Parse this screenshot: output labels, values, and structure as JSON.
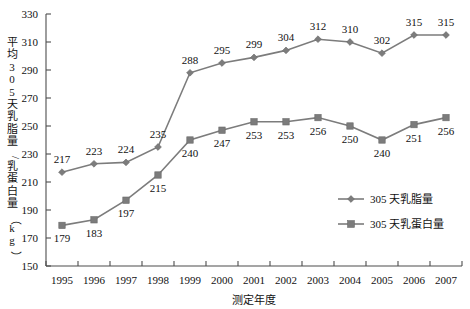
{
  "chart_data": {
    "type": "line",
    "title": "",
    "xlabel": "测定年度",
    "ylabel": "平均305天乳脂量/乳蛋白量（kg）",
    "ylabel_chars": [
      "平",
      "均",
      "3",
      "0",
      "5",
      "天",
      "乳",
      "脂",
      "量",
      "/",
      "乳",
      "蛋",
      "白",
      "量",
      "（",
      "k",
      "g",
      "）"
    ],
    "categories": [
      "1995",
      "1996",
      "1997",
      "1998",
      "1999",
      "2000",
      "2001",
      "2002",
      "2003",
      "2004",
      "2005",
      "2006",
      "2007"
    ],
    "x": [
      1995,
      1996,
      1997,
      1998,
      1999,
      2000,
      2001,
      2002,
      2003,
      2004,
      2005,
      2006,
      2007
    ],
    "ylim": [
      150,
      330
    ],
    "ytick_step": 20,
    "yticks": [
      "330",
      "310",
      "290",
      "270",
      "250",
      "230",
      "210",
      "190",
      "170",
      "150"
    ],
    "ytick_values": [
      330,
      310,
      290,
      270,
      250,
      230,
      210,
      190,
      170,
      150
    ],
    "grid": false,
    "legend_position": "inside-right-lower",
    "series": [
      {
        "name": "305 天乳脂量",
        "marker": "diamond",
        "color": "#7c7c7c",
        "values": [
          217,
          223,
          224,
          235,
          288,
          295,
          299,
          304,
          312,
          310,
          302,
          315,
          315
        ],
        "label_positions": [
          "above",
          "above",
          "above",
          "above",
          "above",
          "above",
          "above",
          "above",
          "above",
          "above",
          "above",
          "above",
          "above"
        ]
      },
      {
        "name": "305 天乳蛋白量",
        "marker": "square",
        "color": "#7c7c7c",
        "values": [
          179,
          183,
          197,
          215,
          240,
          247,
          253,
          253,
          256,
          250,
          240,
          251,
          256
        ],
        "label_positions": [
          "below",
          "below",
          "below",
          "below",
          "below",
          "below",
          "below",
          "below",
          "below",
          "below",
          "below",
          "below",
          "below"
        ]
      }
    ]
  },
  "legend": {
    "items": [
      {
        "label": "305 天乳脂量",
        "marker": "diamond"
      },
      {
        "label": "305 天乳蛋白量",
        "marker": "square"
      }
    ]
  },
  "colors": {
    "series": "#7c7c7c",
    "axis": "#4d4d4d",
    "text": "#111111",
    "background": "#ffffff"
  }
}
